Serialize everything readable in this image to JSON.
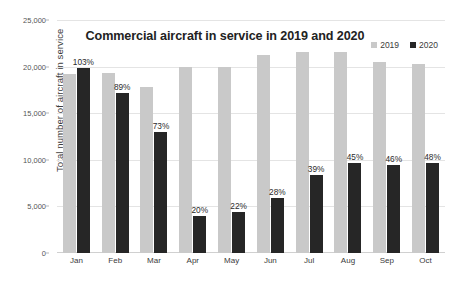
{
  "chart_data": {
    "type": "bar",
    "title": "Commercial aircraft in service in 2019 and 2020",
    "xlabel": "",
    "ylabel": "Total number of aircraft in service",
    "categories": [
      "Jan",
      "Feb",
      "Mar",
      "Apr",
      "May",
      "Jun",
      "Jul",
      "Aug",
      "Sep",
      "Oct"
    ],
    "ylim": [
      0,
      25000
    ],
    "yticks": [
      0,
      5000,
      10000,
      15000,
      20000,
      25000
    ],
    "ytick_labels": [
      "0",
      "5,000",
      "10,000",
      "15,000",
      "20,000",
      "25,000"
    ],
    "grid": true,
    "legend_position": "top-right",
    "series": [
      {
        "name": "2019",
        "color": "#c9c9c9",
        "values": [
          19200,
          19300,
          17800,
          20000,
          20000,
          21200,
          21600,
          21600,
          20500,
          20300
        ]
      },
      {
        "name": "2020",
        "color": "#262626",
        "values": [
          19800,
          17200,
          13000,
          4000,
          4400,
          5900,
          8400,
          9700,
          9400,
          9700
        ],
        "data_labels": [
          "103%",
          "89%",
          "73%",
          "20%",
          "22%",
          "28%",
          "39%",
          "45%",
          "46%",
          "48%"
        ]
      }
    ]
  },
  "legend": [
    {
      "label": "2019",
      "color": "#c9c9c9"
    },
    {
      "label": "2020",
      "color": "#262626"
    }
  ]
}
